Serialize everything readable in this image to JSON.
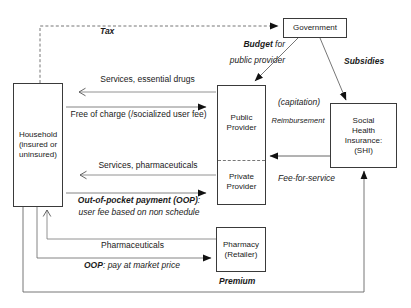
{
  "nodes": {
    "household": {
      "label": "Household\n(insured or\nuninsured)"
    },
    "government": {
      "label": "Government"
    },
    "public_provider": {
      "label": "Public\nProvider"
    },
    "private_provider": {
      "label": "Private\nProvider"
    },
    "shi": {
      "label": "Social\nHealth\nInsurance:\n(SHI)"
    },
    "pharmacy": {
      "label": "Pharmacy\n(Retailer)"
    }
  },
  "edges": {
    "tax": {
      "label": "Tax"
    },
    "services_drugs": {
      "label": "Services, essential drugs"
    },
    "free_charge": {
      "label": "Free of charge (/socialized user fee)"
    },
    "budget": {
      "bold": "Budget",
      "rest": " for"
    },
    "budget_line2": {
      "label": "public provider"
    },
    "subsidies": {
      "label": "Subsidies"
    },
    "capitation": {
      "label": "(capitation)"
    },
    "reimbursement": {
      "label": "Reimbursement"
    },
    "fee_for_service": {
      "label": "Fee-for-service"
    },
    "services_pharma": {
      "label": "Services, pharmaceuticals"
    },
    "oop_payment": {
      "bold": "Out-of-pocket payment (OOP)",
      "rest": ":"
    },
    "oop_user_fee": {
      "label": "user fee based on non schedule"
    },
    "pharmaceuticals": {
      "label": "Pharmaceuticals"
    },
    "oop_market": {
      "bold": "OOP",
      "rest": ": pay at market price"
    },
    "premium": {
      "label": "Premium"
    }
  },
  "colors": {
    "background": "#ffffff",
    "line": "#666666",
    "arrowhead": "#111111",
    "border": "#3a3a3a",
    "text": "#1a1a1a"
  }
}
